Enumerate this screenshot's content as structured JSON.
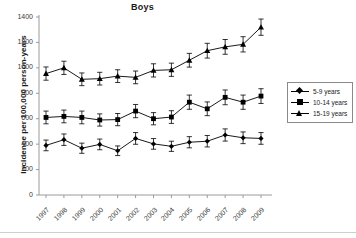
{
  "chart_data": {
    "type": "line",
    "title": "Boys",
    "xlabel": "",
    "ylabel": "Incidence per 100,000 person-years",
    "categories": [
      "1997",
      "1998",
      "1999",
      "2000",
      "2001",
      "2002",
      "2003",
      "2004",
      "2005",
      "2006",
      "2007",
      "2008",
      "2009"
    ],
    "x": [
      1997,
      1998,
      1999,
      2000,
      2001,
      2002,
      2003,
      2004,
      2005,
      2006,
      2007,
      2008,
      2009
    ],
    "ylim": [
      0,
      1400
    ],
    "yticks": [
      0,
      200,
      400,
      600,
      800,
      1000,
      1200,
      1400
    ],
    "grid": false,
    "legend_position": "right",
    "error_bars": true,
    "series": [
      {
        "name": "5-9 years",
        "marker": "diamond",
        "values": [
          390,
          435,
          368,
          398,
          348,
          445,
          402,
          383,
          415,
          423,
          472,
          450,
          445
        ],
        "err_low": [
          42,
          45,
          40,
          42,
          38,
          46,
          42,
          40,
          44,
          45,
          48,
          46,
          46
        ],
        "err_high": [
          42,
          45,
          40,
          42,
          38,
          46,
          42,
          40,
          44,
          45,
          48,
          46,
          46
        ]
      },
      {
        "name": "10-14 years",
        "marker": "square",
        "values": [
          610,
          618,
          610,
          590,
          593,
          660,
          600,
          613,
          730,
          678,
          768,
          730,
          778
        ],
        "err_low": [
          50,
          50,
          50,
          48,
          48,
          52,
          48,
          50,
          56,
          54,
          58,
          56,
          58
        ],
        "err_high": [
          50,
          50,
          50,
          48,
          48,
          52,
          48,
          50,
          56,
          54,
          58,
          56,
          58
        ]
      },
      {
        "name": "15-19 years",
        "marker": "triangle",
        "values": [
          955,
          1000,
          910,
          915,
          935,
          925,
          980,
          985,
          1060,
          1135,
          1165,
          1185,
          1320
        ],
        "err_low": [
          52,
          52,
          50,
          50,
          50,
          50,
          52,
          52,
          54,
          58,
          58,
          60,
          64
        ],
        "err_high": [
          52,
          52,
          50,
          50,
          50,
          50,
          52,
          52,
          54,
          58,
          58,
          60,
          64
        ]
      }
    ],
    "colors": {
      "series": "#000000",
      "axis": "#9a9a9a",
      "text": "#1a1a1a"
    }
  },
  "legend": {
    "items": [
      {
        "label": "5-9 years",
        "marker": "diamond"
      },
      {
        "label": "10-14 years",
        "marker": "square"
      },
      {
        "label": "15-19 years",
        "marker": "triangle"
      }
    ]
  }
}
